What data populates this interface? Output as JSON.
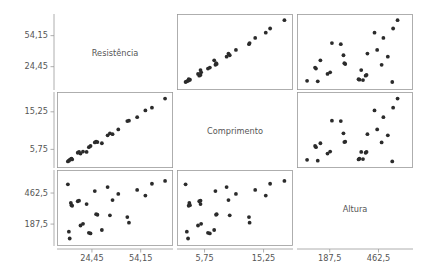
{
  "chart_data": {
    "type": "scatter",
    "title": "",
    "subtitle": "",
    "matrix": true,
    "variables": [
      "Resistencia",
      "Comprimento",
      "Altura"
    ],
    "variable_labels": [
      "Resistência",
      "Comprimento",
      "Altura"
    ],
    "axis_ticks": {
      "Resistencia": [
        "24,45",
        "54,15"
      ],
      "Comprimento": [
        "5,75",
        "15,25"
      ],
      "Altura": [
        "187,5",
        "462,5"
      ]
    },
    "axis_tick_values": {
      "Resistencia": [
        24.45,
        54.15
      ],
      "Comprimento": [
        5.75,
        15.25
      ],
      "Altura": [
        187.5,
        462.5
      ]
    },
    "axis_ranges": {
      "Resistencia": [
        5.0,
        72.0
      ],
      "Comprimento": [
        1.8,
        19.5
      ],
      "Altura": [
        20.0,
        640.0
      ]
    },
    "grid": false,
    "legend": "none",
    "xlabel": "",
    "ylabel": "",
    "points": [
      {
        "Resistencia": 9.8,
        "Comprimento": 2.7,
        "Altura": 540
      },
      {
        "Resistencia": 10.4,
        "Comprimento": 2.9,
        "Altura": 120
      },
      {
        "Resistencia": 10.9,
        "Comprimento": 3.1,
        "Altura": 60
      },
      {
        "Resistencia": 11.6,
        "Comprimento": 3.3,
        "Altura": 375
      },
      {
        "Resistencia": 12.0,
        "Comprimento": 3.4,
        "Altura": 355
      },
      {
        "Resistencia": 12.4,
        "Comprimento": 3.2,
        "Altura": 350
      },
      {
        "Resistencia": 15.8,
        "Comprimento": 4.9,
        "Altura": 390
      },
      {
        "Resistencia": 16.6,
        "Comprimento": 5.1,
        "Altura": 395
      },
      {
        "Resistencia": 17.5,
        "Comprimento": 4.7,
        "Altura": 175
      },
      {
        "Resistencia": 19.0,
        "Comprimento": 5.2,
        "Altura": 190
      },
      {
        "Resistencia": 21.2,
        "Comprimento": 5.1,
        "Altura": 365
      },
      {
        "Resistencia": 22.6,
        "Comprimento": 6.3,
        "Altura": 110
      },
      {
        "Resistencia": 23.6,
        "Comprimento": 6.6,
        "Altura": 105
      },
      {
        "Resistencia": 26.2,
        "Comprimento": 7.5,
        "Altura": 480
      },
      {
        "Resistencia": 27.0,
        "Comprimento": 7.7,
        "Altura": 275
      },
      {
        "Resistencia": 27.8,
        "Comprimento": 7.6,
        "Altura": 270
      },
      {
        "Resistencia": 30.5,
        "Comprimento": 7.3,
        "Altura": 135
      },
      {
        "Resistencia": 34.0,
        "Comprimento": 9.3,
        "Altura": 515
      },
      {
        "Resistencia": 35.4,
        "Comprimento": 9.8,
        "Altura": 265
      },
      {
        "Resistencia": 37.0,
        "Comprimento": 9.6,
        "Altura": 400
      },
      {
        "Resistencia": 40.5,
        "Comprimento": 10.8,
        "Altura": 455
      },
      {
        "Resistencia": 46.0,
        "Comprimento": 12.9,
        "Altura": 250
      },
      {
        "Resistencia": 47.0,
        "Comprimento": 13.0,
        "Altura": 200
      },
      {
        "Resistencia": 52.0,
        "Comprimento": 13.9,
        "Altura": 490
      },
      {
        "Resistencia": 57.0,
        "Comprimento": 15.6,
        "Altura": 440
      },
      {
        "Resistencia": 61.0,
        "Comprimento": 16.3,
        "Altura": 545
      },
      {
        "Resistencia": 69.0,
        "Comprimento": 18.6,
        "Altura": 570
      }
    ]
  },
  "style": {
    "dot_color": "#2b2b2b",
    "frame_color": "#9a9a9a",
    "text_color": "#555555",
    "background": "#ffffff",
    "dot_radius": 1.9
  }
}
